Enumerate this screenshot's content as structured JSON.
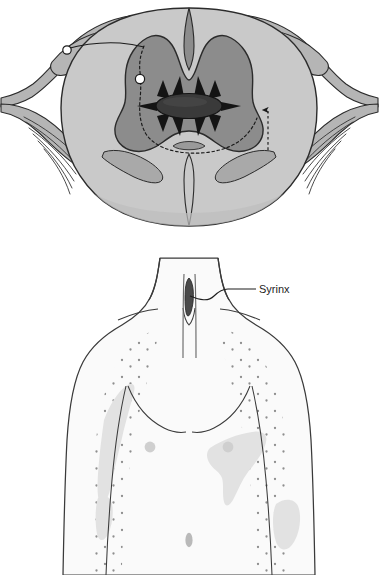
{
  "figure": {
    "panels": [
      {
        "id": "spinal-cord-cross-section",
        "name": "Spinal cord cross-section with expanding syrinx",
        "structures": [
          "white-matter",
          "gray-matter-butterfly",
          "central-syrinx-cavity",
          "posterior-median-septum",
          "anterior-median-fissure",
          "dorsal-root",
          "dorsal-root-ganglion",
          "ventral-root",
          "nerve-rootlets",
          "lateral-spinothalamic-tract"
        ]
      },
      {
        "id": "body-sensory-distribution",
        "name": "Torso showing cape-distribution sensory loss",
        "structures": [
          "neck",
          "shoulders",
          "chest",
          "arms",
          "nipples",
          "umbilicus",
          "stippled-sensory-loss-region",
          "cervical-spinal-canal",
          "syrinx-cavity"
        ]
      }
    ]
  },
  "labels": {
    "syrinx": "Syrinx"
  },
  "colors": {
    "background": "#ffffff",
    "white_matter": "#c9c9c9",
    "gray_matter": "#8c8c8c",
    "syrinx_cavity": "#3a3a3a",
    "nerve_root": "#b5b5b5",
    "outline": "#2b2b2b",
    "skin_fill": "#fafafa",
    "skin_outline": "#3a3a3a",
    "shading_patch": "#e2e2e2",
    "stipple_dot": "#8e8e8e",
    "nipple": "#cfcfcf",
    "label_text": "#1d1d1d",
    "leader_line": "#1d1d1d"
  }
}
